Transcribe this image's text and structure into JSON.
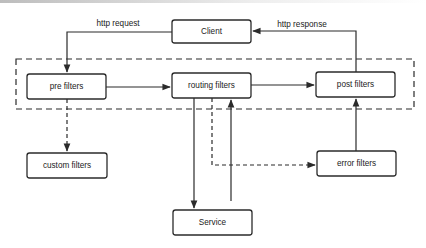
{
  "diagram": {
    "type": "flow",
    "group": {
      "name": "filter-chain",
      "style": "dashed",
      "x": 16,
      "y": 59,
      "w": 398,
      "h": 50
    },
    "nodes": [
      {
        "id": "client",
        "label": "Client",
        "x": 172,
        "y": 20,
        "w": 79,
        "h": 23
      },
      {
        "id": "pre",
        "label": "pre filters",
        "x": 27,
        "y": 74,
        "w": 79,
        "h": 25
      },
      {
        "id": "routing",
        "label": "routing filters",
        "x": 172,
        "y": 73,
        "w": 79,
        "h": 25
      },
      {
        "id": "post",
        "label": "post filters",
        "x": 316,
        "y": 72,
        "w": 79,
        "h": 25
      },
      {
        "id": "custom",
        "label": "custom filters",
        "x": 27,
        "y": 153,
        "w": 80,
        "h": 25
      },
      {
        "id": "error",
        "label": "error filters",
        "x": 317,
        "y": 151,
        "w": 79,
        "h": 25
      },
      {
        "id": "service",
        "label": "Service",
        "x": 173,
        "y": 210,
        "w": 79,
        "h": 25
      }
    ],
    "edge_labels": {
      "http_request": "http request",
      "http_response": "http response"
    },
    "edges": [
      {
        "from": "client",
        "to": "pre",
        "style": "solid",
        "label": "http request"
      },
      {
        "from": "pre",
        "to": "routing",
        "style": "solid"
      },
      {
        "from": "routing",
        "to": "post",
        "style": "solid"
      },
      {
        "from": "post",
        "to": "client",
        "style": "solid",
        "label": "http response"
      },
      {
        "from": "pre",
        "to": "custom",
        "style": "dashed"
      },
      {
        "from": "routing",
        "to": "service",
        "style": "solid"
      },
      {
        "from": "service",
        "to": "routing",
        "style": "solid"
      },
      {
        "from": "routing",
        "to": "error",
        "style": "dashed"
      },
      {
        "from": "error",
        "to": "post",
        "style": "solid"
      }
    ]
  }
}
